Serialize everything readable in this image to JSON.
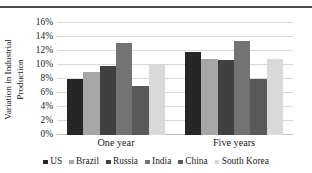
{
  "chart_data": {
    "type": "bar",
    "title": "",
    "xlabel": "",
    "ylabel": "Variation in Industrial Production",
    "categories": [
      "One year",
      "Five years"
    ],
    "ylim": [
      0,
      16
    ],
    "yticks": [
      "0%",
      "2%",
      "4%",
      "6%",
      "8%",
      "10%",
      "12%",
      "14%",
      "16%"
    ],
    "ytick_values": [
      0,
      2,
      4,
      6,
      8,
      10,
      12,
      14,
      16
    ],
    "grid": true,
    "legend_position": "bottom",
    "series": [
      {
        "name": "US",
        "color": "#262626",
        "values": [
          8.0,
          11.8
        ]
      },
      {
        "name": "Brazil",
        "color": "#a6a6a6",
        "values": [
          9.0,
          10.9
        ]
      },
      {
        "name": "Russia",
        "color": "#404040",
        "values": [
          9.8,
          10.7
        ]
      },
      {
        "name": "India",
        "color": "#737373",
        "values": [
          13.2,
          13.4
        ]
      },
      {
        "name": "China",
        "color": "#595959",
        "values": [
          7.0,
          8.0
        ]
      },
      {
        "name": "South Korea",
        "color": "#d9d9d9",
        "values": [
          10.2,
          10.8
        ]
      }
    ]
  },
  "axis": {
    "y_title_line1": "Variation in Industrial",
    "y_title_line2": "Production"
  }
}
